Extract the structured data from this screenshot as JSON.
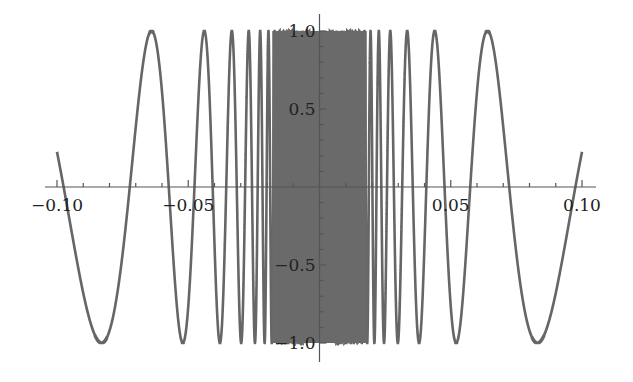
{
  "chart_data": {
    "type": "line",
    "title": "",
    "xlabel": "",
    "ylabel": "",
    "function_description": "rapidly oscillating even function, oscillation frequency increases toward x=0 (sin(1/x)-like)",
    "xlim": [
      -0.1,
      0.1
    ],
    "ylim": [
      -1.0,
      1.0
    ],
    "x_ticks": [
      {
        "value": -0.1,
        "label": "-0.10"
      },
      {
        "value": -0.05,
        "label": "-0.05"
      },
      {
        "value": 0.05,
        "label": "0.05"
      },
      {
        "value": 0.1,
        "label": "0.10"
      }
    ],
    "y_ticks": [
      {
        "value": 1.0,
        "label": "1.0"
      },
      {
        "value": 0.5,
        "label": "0.5"
      },
      {
        "value": -0.5,
        "label": "-0.5"
      },
      {
        "value": -1.0,
        "label": "-1.0"
      }
    ],
    "sample_points": [
      {
        "x": -0.1,
        "y": 0.7
      },
      {
        "x": -0.083,
        "y": -1.0
      },
      {
        "x": -0.064,
        "y": 1.0
      },
      {
        "x": -0.05,
        "y": -1.0
      },
      {
        "x": 0.05,
        "y": -1.0
      },
      {
        "x": 0.064,
        "y": 1.0
      },
      {
        "x": 0.083,
        "y": -1.0
      },
      {
        "x": 0.1,
        "y": 0.7
      }
    ],
    "grid": false,
    "legend": null,
    "colors": {
      "curve": "#666666",
      "axis": "#555555",
      "text": "#222222"
    }
  }
}
